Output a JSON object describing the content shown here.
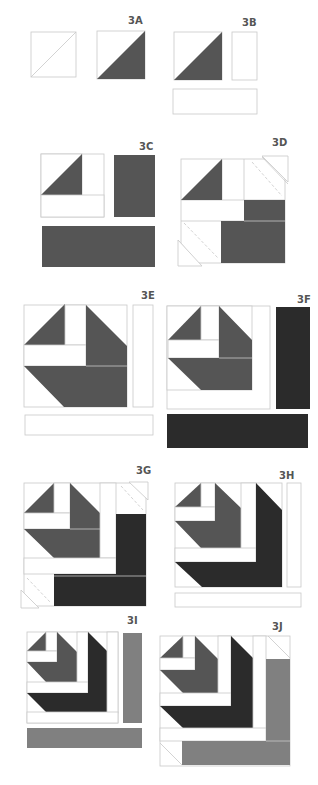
{
  "colors": {
    "outline": "#c8c8c8",
    "dark_gray": "#555555",
    "black": "#2b2b2b",
    "medium_gray": "#808080",
    "background": "#ffffff",
    "label": "#555555"
  },
  "steps": [
    {
      "id": "3A",
      "label": "3A",
      "description": "Square with diagonal line becomes half-square triangle (white/dark gray)"
    },
    {
      "id": "3B",
      "label": "3B",
      "description": "Half-square triangle with white strips"
    },
    {
      "id": "3C",
      "label": "3C",
      "description": "Unit with white strips, dark gray rectangle and strip"
    },
    {
      "id": "3D",
      "label": "3D",
      "description": "Dark gray added with corner snowball triangles"
    },
    {
      "id": "3E",
      "label": "3E",
      "description": "Block with white strips"
    },
    {
      "id": "3F",
      "label": "3F",
      "description": "Block with black strips"
    },
    {
      "id": "3G",
      "label": "3G",
      "description": "Black added with corner snowball triangles"
    },
    {
      "id": "3H",
      "label": "3H",
      "description": "Block with white strips"
    },
    {
      "id": "3I",
      "label": "3I",
      "description": "Block with medium gray strips"
    },
    {
      "id": "3J",
      "label": "3J",
      "description": "Medium gray added with corner triangles"
    }
  ]
}
